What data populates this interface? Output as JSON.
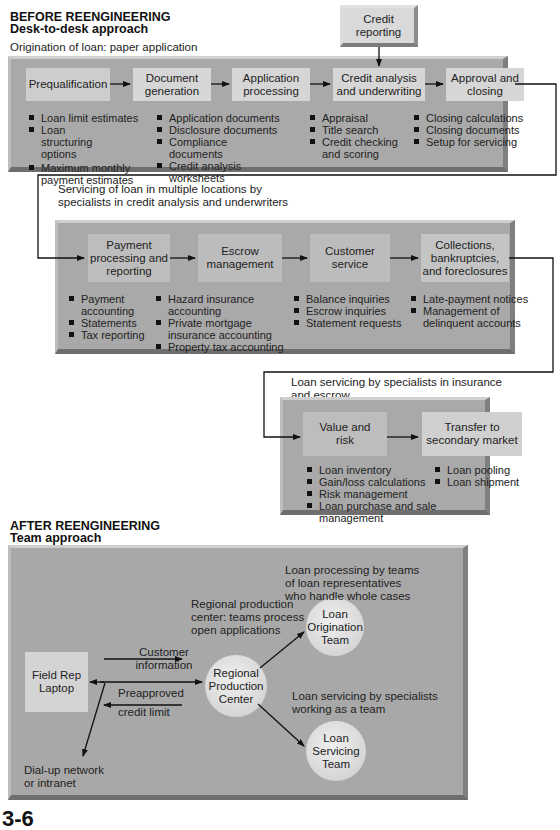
{
  "before": {
    "title": "BEFORE REENGINEERING",
    "subtitle": "Desk-to-desk approach",
    "origination": {
      "caption": "Origination of loan: paper application",
      "credit_reporting": "Credit reporting",
      "steps": [
        {
          "label": "Prequalification",
          "bullets": [
            "Loan limit estimates",
            "Loan structuring options",
            "Maximum monthly payment estimates"
          ]
        },
        {
          "label": "Document generation",
          "bullets": [
            "Application documents",
            "Disclosure documents",
            "Compliance documents",
            "Credit analysis worksheets"
          ]
        },
        {
          "label": "Application processing",
          "bullets": []
        },
        {
          "label": "Credit analysis and underwriting",
          "bullets": [
            "Appraisal",
            "Title search",
            "Credit checking and scoring"
          ]
        },
        {
          "label": "Approval and closing",
          "bullets": [
            "Closing calculations",
            "Closing documents",
            "Setup for servicing"
          ]
        }
      ]
    },
    "servicing": {
      "caption": "Servicing of loan in multiple locations by specialists in credit analysis and underwriters",
      "steps": [
        {
          "label": "Payment processing and reporting",
          "bullets": [
            "Payment accounting",
            "Statements",
            "Tax reporting"
          ]
        },
        {
          "label": "Escrow management",
          "bullets": [
            "Hazard insurance accounting",
            "Private mortgage insurance accounting",
            "Property tax accounting"
          ]
        },
        {
          "label": "Customer service",
          "bullets": [
            "Balance inquiries",
            "Escrow inquiries",
            "Statement requests"
          ]
        },
        {
          "label": "Collections, bankruptcies, and foreclosures",
          "bullets": [
            "Late-payment notices",
            "Management of delinquent accounts"
          ]
        }
      ]
    },
    "insurance": {
      "caption": "Loan servicing by specialists in insurance and escrow",
      "steps": [
        {
          "label": "Value and risk",
          "bullets": [
            "Loan inventory",
            "Gain/loss calculations",
            "Risk management",
            "Loan purchase and sale management"
          ]
        },
        {
          "label": "Transfer to secondary market",
          "bullets": [
            "Loan pooling",
            "Loan shipment"
          ]
        }
      ]
    }
  },
  "after": {
    "title": "AFTER REENGINEERING",
    "subtitle": "Team approach",
    "field_rep": "Field Rep Laptop",
    "regional_center": "Regional Production Center",
    "origination_team": "Loan Origination Team",
    "servicing_team": "Loan Servicing Team",
    "customer_info": "Customer information",
    "preapproved": "Preapproved",
    "credit_limit": "credit limit",
    "dialup": "Dial-up network or intranet",
    "regional_note": "Regional production center: teams process open applications",
    "origination_note": "Loan processing by teams of loan representatives who handle whole cases",
    "servicing_note": "Loan servicing by specialists working as a team"
  },
  "page_number": "3-6"
}
